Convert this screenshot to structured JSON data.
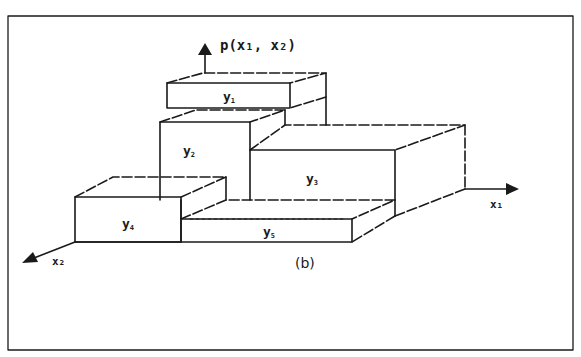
{
  "figure": {
    "caption": "(b)",
    "axis_vertical_label": "p(x₁, x₂)",
    "axis_right_label": "x₁",
    "axis_left_label": "x₂"
  },
  "blocks": [
    {
      "id": "y1",
      "label": "y",
      "sub": "1"
    },
    {
      "id": "y2",
      "label": "y",
      "sub": "2"
    },
    {
      "id": "y3",
      "label": "y",
      "sub": "3"
    },
    {
      "id": "y4",
      "label": "y",
      "sub": "4"
    },
    {
      "id": "y5",
      "label": "y",
      "sub": "5"
    }
  ],
  "colors": {
    "ink": "#1a1a1a",
    "background": "#ffffff"
  }
}
